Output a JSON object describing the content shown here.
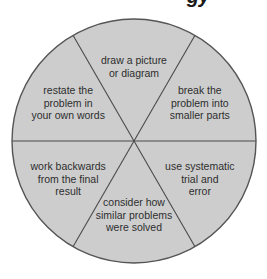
{
  "title_fragment": "gy",
  "colors": {
    "slice_fill": "#cdcdcd",
    "outline": "#555555",
    "divider": "#4a4a4a",
    "text": "#2e2e2e",
    "background": "#ffffff"
  },
  "slices": [
    {
      "id": "top",
      "lines": [
        "draw a picture",
        "or diagram"
      ]
    },
    {
      "id": "upper-right",
      "lines": [
        "break the",
        "problem into",
        "smaller parts"
      ]
    },
    {
      "id": "lower-right",
      "lines": [
        "use systematic",
        "trial and",
        "error"
      ]
    },
    {
      "id": "bottom",
      "lines": [
        "consider how",
        "similar problems",
        "were solved"
      ]
    },
    {
      "id": "lower-left",
      "lines": [
        "work backwards",
        "from the final",
        "result"
      ]
    },
    {
      "id": "upper-left",
      "lines": [
        "restate the",
        "problem in",
        "your own words"
      ]
    }
  ]
}
